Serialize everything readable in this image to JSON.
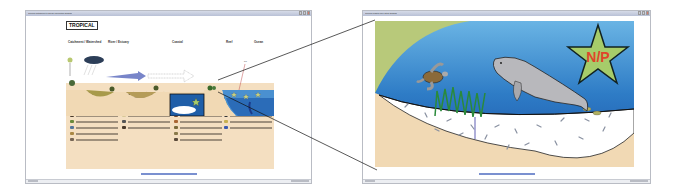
{
  "left_window": {
    "title": "Tropical Catchment to Ocean conceptual diagram",
    "window_controls": [
      "minimize",
      "maximize",
      "close"
    ],
    "diagram": {
      "region_tag": "TROPICAL",
      "zones": [
        "Catchment / Watershed",
        "River / Estuary",
        "Coastal",
        "Reef",
        "Ocean"
      ],
      "callout_label": "Fe",
      "legend_columns": [
        {
          "header": "Rapidly degrading ecosystems",
          "items": [
            "Item 1",
            "Item 2",
            "Item 3",
            "Item 4",
            "Item 5",
            "Item 6",
            "Item 7",
            "Item 8"
          ]
        },
        {
          "header": "Impacted by coastal development",
          "items": [
            "Item 1",
            "Item 2",
            "Item 3",
            "Item 4",
            "Item 5",
            "Item 6"
          ]
        },
        {
          "header": "Flood runoff",
          "items": [
            "Item 1",
            "Item 2",
            "Item 3",
            "Item 4",
            "Item 5",
            "Item 6",
            "Item 7",
            "Item 8"
          ]
        },
        {
          "header": "Impacts",
          "items": [
            "Item 1",
            "Item 2",
            "Item 3",
            "Item 4",
            "Item 5",
            "Item 6"
          ]
        }
      ]
    },
    "caption": "Click on image to zoom in",
    "status_left": "Done",
    "status_right": "Internet"
  },
  "right_window": {
    "title": "Tropical coastal zone detail diagram",
    "window_controls": [
      "minimize",
      "maximize",
      "close"
    ],
    "zoom_image": {
      "star_label": "N/P",
      "animals": [
        "sea-turtle",
        "dugong"
      ],
      "features": [
        "seagrass",
        "sediment",
        "sand-bank"
      ]
    },
    "caption": "Click on image to return",
    "status_left": "Done",
    "status_right": "Internet"
  },
  "colors": {
    "sand": "#f4dfc1",
    "ocean_deep": "#1e5fae",
    "ocean_light": "#5aa6dc",
    "grass_bank": "#b8c97a",
    "star_fill": "#a6cc6a",
    "star_text": "#e0452a",
    "title_bar": "#c3c9da"
  }
}
